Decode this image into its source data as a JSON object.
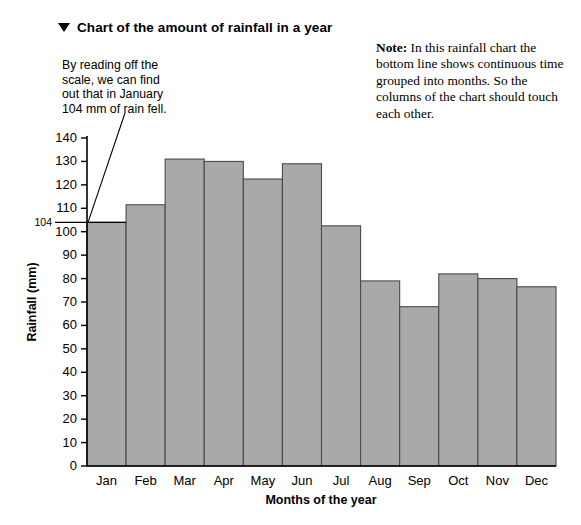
{
  "title": {
    "marker": "▼",
    "text": "Chart of the amount of rainfall in a year"
  },
  "callout": {
    "lines": [
      "By reading off the",
      "scale, we can find",
      "out that in January",
      "104 mm of rain fell."
    ]
  },
  "note": {
    "label": "Note:",
    "text": " In this rainfall chart the bottom line shows continuous time grouped into months. So the columns of the chart should touch each other."
  },
  "colors": {
    "bar_fill": "#a9a9a9",
    "bar_stroke": "#4a4a4a",
    "axis": "#000000",
    "background": "#ffffff"
  },
  "chart_data": {
    "type": "bar",
    "title": "Chart of the amount of rainfall in a year",
    "xlabel": "Months of the year",
    "ylabel": "Rainfall (mm)",
    "categories": [
      "Jan",
      "Feb",
      "Mar",
      "Apr",
      "May",
      "Jun",
      "Jul",
      "Aug",
      "Sep",
      "Oct",
      "Nov",
      "Dec"
    ],
    "values": [
      104,
      111.5,
      131,
      130,
      122.5,
      129,
      102.5,
      79,
      68,
      82,
      80,
      76.5
    ],
    "ylim": [
      0,
      140
    ],
    "ytick_step": 10,
    "yticks": [
      0,
      10,
      20,
      30,
      40,
      50,
      60,
      70,
      80,
      90,
      100,
      110,
      120,
      130,
      140
    ],
    "ytick_labels": [
      "0",
      "10",
      "20",
      "30",
      "40",
      "50",
      "60",
      "70",
      "80",
      "90",
      "100",
      "110",
      "120",
      "130",
      "140"
    ],
    "special_ytick": {
      "value": 104,
      "label": "104"
    },
    "grid": false,
    "legend": false,
    "bars_touch": true,
    "annotation": "By reading off the scale, we can find out that in January 104 mm of rain fell."
  }
}
